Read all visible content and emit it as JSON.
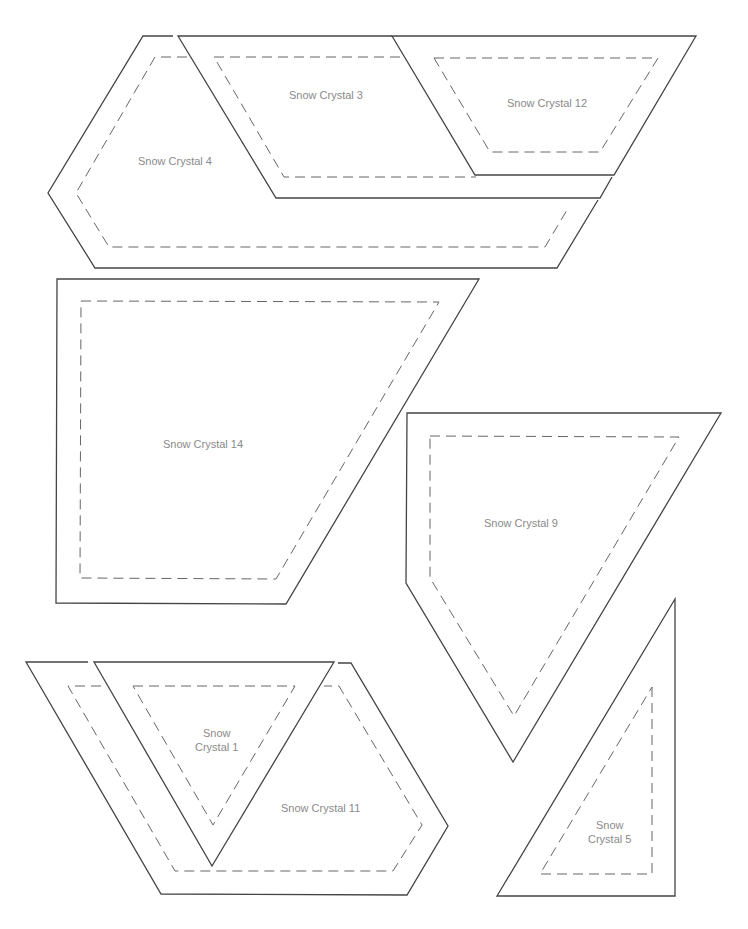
{
  "pieces": [
    {
      "id": "sc4",
      "label": "Snow Crystal 4"
    },
    {
      "id": "sc3",
      "label": "Snow Crystal 3"
    },
    {
      "id": "sc12",
      "label": "Snow Crystal 12"
    },
    {
      "id": "sc14",
      "label": "Snow Crystal 14"
    },
    {
      "id": "sc9",
      "label": "Snow Crystal 9"
    },
    {
      "id": "sc1",
      "label_line1": "Snow",
      "label_line2": "Crystal 1"
    },
    {
      "id": "sc11",
      "label": "Snow Crystal 11"
    },
    {
      "id": "sc5",
      "label_line1": "Snow",
      "label_line2": "Crystal 5"
    }
  ],
  "legend": {
    "solid_line": "cutting line",
    "dashed_line": "seam line"
  },
  "colors": {
    "line": "#444444",
    "seam": "#666666",
    "text": "#8a8a8a",
    "background": "#ffffff"
  }
}
